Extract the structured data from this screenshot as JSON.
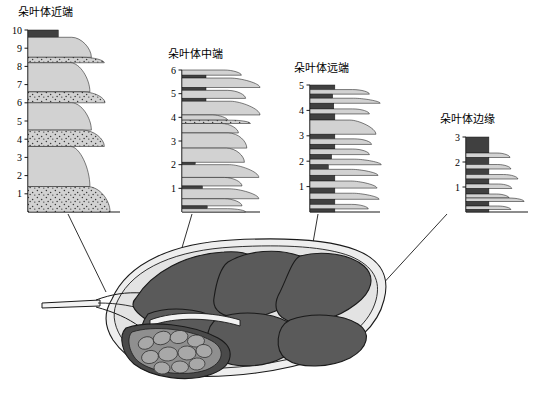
{
  "figure": {
    "title_visible": false,
    "background": "#ffffff",
    "line_color": "#1a1a1a"
  },
  "panels": [
    {
      "id": "proximal",
      "title": "朵叶体近端",
      "axis_max": 10,
      "axis_ticks": [
        1,
        2,
        3,
        4,
        5,
        6,
        7,
        8,
        9,
        10
      ],
      "x": 28,
      "y": 30,
      "width": 82,
      "height": 182
    },
    {
      "id": "middle",
      "title": "朵叶体中端",
      "axis_max": 6,
      "axis_ticks": [
        1,
        2,
        3,
        4,
        5,
        6
      ],
      "x": 182,
      "y": 70,
      "width": 62,
      "height": 142
    },
    {
      "id": "distal",
      "title": "朵叶体远端",
      "axis_max": 5,
      "axis_ticks": [
        1,
        2,
        3,
        4,
        5
      ],
      "x": 310,
      "y": 85,
      "width": 58,
      "height": 127
    },
    {
      "id": "margin",
      "title": "朵叶体边缘",
      "axis_max": 3,
      "axis_ticks": [
        1,
        2,
        3
      ],
      "x": 466,
      "y": 137,
      "width": 48,
      "height": 75
    }
  ],
  "chart_data": [
    {
      "id": "proximal",
      "type": "bar",
      "orientation": "horizontal-stacked-log",
      "title": "朵叶体近端",
      "ylabel": "",
      "xlabel": "",
      "ylim": [
        0,
        10
      ],
      "grid": false,
      "beds": [
        {
          "top": 10.0,
          "base": 9.6,
          "width": 0.42,
          "fill": "dark",
          "texture": "none"
        },
        {
          "top": 9.6,
          "base": 8.5,
          "width": 0.74,
          "fill": "light",
          "texture": "plain"
        },
        {
          "top": 8.5,
          "base": 8.2,
          "width": 0.92,
          "fill": "light",
          "texture": "speckled"
        },
        {
          "top": 8.2,
          "base": 6.6,
          "width": 0.72,
          "fill": "light",
          "texture": "plain"
        },
        {
          "top": 6.6,
          "base": 6.0,
          "width": 0.93,
          "fill": "light",
          "texture": "speckled"
        },
        {
          "top": 6.0,
          "base": 4.5,
          "width": 0.74,
          "fill": "light",
          "texture": "plain"
        },
        {
          "top": 4.5,
          "base": 3.6,
          "width": 0.92,
          "fill": "light",
          "texture": "speckled"
        },
        {
          "top": 3.6,
          "base": 1.4,
          "width": 0.72,
          "fill": "light",
          "texture": "plain"
        },
        {
          "top": 1.4,
          "base": 0.0,
          "width": 1.0,
          "fill": "light",
          "texture": "speckled"
        }
      ]
    },
    {
      "id": "middle",
      "type": "bar",
      "orientation": "horizontal-stacked-log",
      "title": "朵叶体中端",
      "ylim": [
        0,
        6
      ],
      "grid": false,
      "beds": [
        {
          "top": 6.0,
          "base": 5.78,
          "width": 0.85,
          "fill": "light",
          "texture": "plain"
        },
        {
          "top": 5.78,
          "base": 5.66,
          "width": 0.4,
          "fill": "dark",
          "texture": "none"
        },
        {
          "top": 5.66,
          "base": 5.26,
          "width": 0.98,
          "fill": "light",
          "texture": "lens"
        },
        {
          "top": 5.26,
          "base": 5.14,
          "width": 0.4,
          "fill": "dark",
          "texture": "none"
        },
        {
          "top": 5.14,
          "base": 4.8,
          "width": 0.92,
          "fill": "light",
          "texture": "plain"
        },
        {
          "top": 4.8,
          "base": 4.68,
          "width": 0.4,
          "fill": "dark",
          "texture": "none"
        },
        {
          "top": 4.68,
          "base": 4.1,
          "width": 0.98,
          "fill": "light",
          "texture": "lens"
        },
        {
          "top": 4.1,
          "base": 3.88,
          "width": 0.62,
          "fill": "light",
          "texture": "plain"
        },
        {
          "top": 3.88,
          "base": 3.74,
          "width": 1.0,
          "fill": "light",
          "texture": "speckled"
        },
        {
          "top": 3.74,
          "base": 3.34,
          "width": 0.8,
          "fill": "light",
          "texture": "plain"
        },
        {
          "top": 3.34,
          "base": 2.7,
          "width": 0.94,
          "fill": "light",
          "texture": "plain"
        },
        {
          "top": 2.7,
          "base": 2.1,
          "width": 0.9,
          "fill": "light",
          "texture": "plain"
        },
        {
          "top": 2.1,
          "base": 2.0,
          "width": 0.22,
          "fill": "dark",
          "texture": "none"
        },
        {
          "top": 2.0,
          "base": 1.46,
          "width": 0.96,
          "fill": "light",
          "texture": "lens"
        },
        {
          "top": 1.46,
          "base": 1.1,
          "width": 0.86,
          "fill": "light",
          "texture": "plain"
        },
        {
          "top": 1.1,
          "base": 0.98,
          "width": 0.34,
          "fill": "dark",
          "texture": "none"
        },
        {
          "top": 0.98,
          "base": 0.56,
          "width": 0.96,
          "fill": "light",
          "texture": "lens"
        },
        {
          "top": 0.56,
          "base": 0.26,
          "width": 0.86,
          "fill": "light",
          "texture": "plain"
        },
        {
          "top": 0.26,
          "base": 0.14,
          "width": 0.42,
          "fill": "dark",
          "texture": "none"
        },
        {
          "top": 0.14,
          "base": 0.0,
          "width": 0.92,
          "fill": "light",
          "texture": "plain"
        }
      ]
    },
    {
      "id": "distal",
      "type": "bar",
      "orientation": "horizontal-stacked-log",
      "title": "朵叶体远端",
      "ylim": [
        0,
        5
      ],
      "grid": false,
      "beds": [
        {
          "top": 5.0,
          "base": 4.82,
          "width": 0.46,
          "fill": "dark",
          "texture": "none"
        },
        {
          "top": 4.82,
          "base": 4.64,
          "width": 0.96,
          "fill": "light",
          "texture": "plain"
        },
        {
          "top": 4.64,
          "base": 4.48,
          "width": 0.42,
          "fill": "dark",
          "texture": "none"
        },
        {
          "top": 4.48,
          "base": 4.28,
          "width": 0.98,
          "fill": "light",
          "texture": "lens"
        },
        {
          "top": 4.28,
          "base": 4.06,
          "width": 0.44,
          "fill": "dark",
          "texture": "none"
        },
        {
          "top": 4.06,
          "base": 3.86,
          "width": 0.96,
          "fill": "light",
          "texture": "plain"
        },
        {
          "top": 3.86,
          "base": 3.62,
          "width": 0.46,
          "fill": "dark",
          "texture": "none"
        },
        {
          "top": 3.62,
          "base": 3.06,
          "width": 0.9,
          "fill": "light",
          "texture": "lens"
        },
        {
          "top": 3.06,
          "base": 2.88,
          "width": 0.46,
          "fill": "dark",
          "texture": "none"
        },
        {
          "top": 2.88,
          "base": 2.66,
          "width": 1.0,
          "fill": "light",
          "texture": "plain"
        },
        {
          "top": 2.66,
          "base": 2.48,
          "width": 0.46,
          "fill": "dark",
          "texture": "none"
        },
        {
          "top": 2.48,
          "base": 2.26,
          "width": 0.96,
          "fill": "light",
          "texture": "plain"
        },
        {
          "top": 2.26,
          "base": 2.08,
          "width": 0.4,
          "fill": "dark",
          "texture": "none"
        },
        {
          "top": 2.08,
          "base": 1.86,
          "width": 1.0,
          "fill": "light",
          "texture": "lens"
        },
        {
          "top": 1.86,
          "base": 1.68,
          "width": 0.34,
          "fill": "dark",
          "texture": "none"
        },
        {
          "top": 1.68,
          "base": 1.44,
          "width": 0.94,
          "fill": "light",
          "texture": "lens"
        },
        {
          "top": 1.44,
          "base": 1.22,
          "width": 0.46,
          "fill": "dark",
          "texture": "none"
        },
        {
          "top": 1.22,
          "base": 0.94,
          "width": 0.92,
          "fill": "light",
          "texture": "lens"
        },
        {
          "top": 0.94,
          "base": 0.74,
          "width": 0.46,
          "fill": "dark",
          "texture": "none"
        },
        {
          "top": 0.74,
          "base": 0.5,
          "width": 0.96,
          "fill": "light",
          "texture": "lens"
        },
        {
          "top": 0.5,
          "base": 0.3,
          "width": 0.46,
          "fill": "dark",
          "texture": "none"
        },
        {
          "top": 0.3,
          "base": 0.12,
          "width": 0.94,
          "fill": "light",
          "texture": "plain"
        },
        {
          "top": 0.12,
          "base": 0.0,
          "width": 0.46,
          "fill": "dark",
          "texture": "none"
        }
      ]
    },
    {
      "id": "margin",
      "type": "bar",
      "orientation": "horizontal-stacked-log",
      "title": "朵叶体边缘",
      "ylim": [
        0,
        3
      ],
      "grid": false,
      "beds": [
        {
          "top": 3.0,
          "base": 2.36,
          "width": 0.52,
          "fill": "dark",
          "texture": "none"
        },
        {
          "top": 2.36,
          "base": 2.18,
          "width": 0.86,
          "fill": "light",
          "texture": "plain"
        },
        {
          "top": 2.18,
          "base": 1.9,
          "width": 0.52,
          "fill": "dark",
          "texture": "none"
        },
        {
          "top": 1.9,
          "base": 1.72,
          "width": 0.88,
          "fill": "light",
          "texture": "plain"
        },
        {
          "top": 1.72,
          "base": 1.5,
          "width": 0.52,
          "fill": "dark",
          "texture": "none"
        },
        {
          "top": 1.5,
          "base": 1.32,
          "width": 1.04,
          "fill": "light",
          "texture": "plain"
        },
        {
          "top": 1.32,
          "base": 1.12,
          "width": 0.52,
          "fill": "dark",
          "texture": "none"
        },
        {
          "top": 1.12,
          "base": 0.94,
          "width": 0.9,
          "fill": "light",
          "texture": "plain"
        },
        {
          "top": 0.94,
          "base": 0.72,
          "width": 0.52,
          "fill": "dark",
          "texture": "none"
        },
        {
          "top": 0.72,
          "base": 0.56,
          "width": 0.84,
          "fill": "light",
          "texture": "plain"
        },
        {
          "top": 0.56,
          "base": 0.42,
          "width": 1.18,
          "fill": "light",
          "texture": "plain"
        },
        {
          "top": 0.42,
          "base": 0.24,
          "width": 0.52,
          "fill": "dark",
          "texture": "none"
        },
        {
          "top": 0.24,
          "base": 0.1,
          "width": 0.88,
          "fill": "light",
          "texture": "plain"
        },
        {
          "top": 0.1,
          "base": 0.0,
          "width": 0.52,
          "fill": "dark",
          "texture": "none"
        }
      ]
    }
  ],
  "leaf_diagram": {
    "name": "lobe-body-plan-view",
    "outer_fill": "#eeeeee",
    "inner_fill": "#e8e8e8",
    "lobe_fill": "#5a5a5a",
    "small_lobe_fill": "#9a9a9a",
    "stroke": "#1a1a1a"
  },
  "leaders": [
    {
      "from_panel": "proximal",
      "note": "proximal-leader"
    },
    {
      "from_panel": "middle",
      "note": "middle-leader"
    },
    {
      "from_panel": "distal",
      "note": "distal-leader"
    },
    {
      "from_panel": "margin",
      "note": "margin-leader"
    }
  ],
  "colors": {
    "bed_light": "#d2d2d2",
    "bed_dark": "#404040",
    "speckle": "#3a3a3a",
    "axis": "#1a1a1a"
  }
}
